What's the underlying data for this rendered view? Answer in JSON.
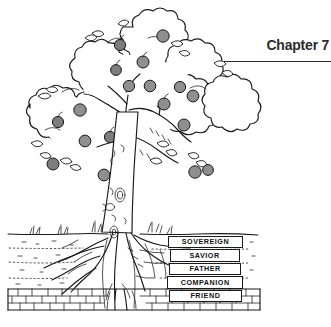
{
  "page": {
    "background_color": "#ffffff",
    "ink_color": "#1a1a1a"
  },
  "header": {
    "chapter_label": "Chapter 7",
    "rule_color": "#2b2b2b"
  },
  "illustration": {
    "name": "apple-tree-with-roots-diagram",
    "description": "Line drawing of an apple tree with a leafy cloud-shaped canopy bearing gray apples, a textured trunk, and an exposed root system below the ground line with soil strata and a stone layer.",
    "apple_fill_color": "#8f8f8f",
    "line_color": "#1a1a1a",
    "parts": [
      {
        "name": "canopy",
        "label": "canopy"
      },
      {
        "name": "apples",
        "label": "apples"
      },
      {
        "name": "trunk",
        "label": "trunk"
      },
      {
        "name": "branches",
        "label": "branches"
      },
      {
        "name": "grass",
        "label": "grass"
      },
      {
        "name": "ground-line",
        "label": "ground line"
      },
      {
        "name": "roots",
        "label": "root system"
      },
      {
        "name": "soil-strata",
        "label": "soil strata"
      },
      {
        "name": "stone-layer",
        "label": "stone layer"
      }
    ]
  },
  "root_labels": {
    "items": [
      {
        "id": "sovereign",
        "text": "SOVEREIGN"
      },
      {
        "id": "savior",
        "text": "SAVIOR"
      },
      {
        "id": "father",
        "text": "FATHER"
      },
      {
        "id": "companion",
        "text": "COMPANION"
      },
      {
        "id": "friend",
        "text": "FRIEND"
      }
    ]
  }
}
